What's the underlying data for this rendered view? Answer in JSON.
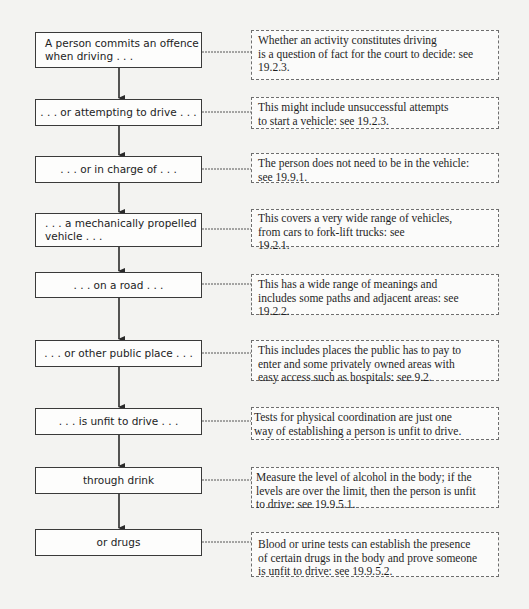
{
  "flowchart": {
    "steps": [
      {
        "label": "A person commits an offence\nwhen driving . . .",
        "note": "Whether an activity constitutes driving\nis a question of fact for the court to decide: see\n19.2.3."
      },
      {
        "label": ". . . or attempting to drive . . .",
        "note": "This might include unsuccessful attempts\nto start a vehicle: see 19.2.3."
      },
      {
        "label": ". . . or in charge of . . .",
        "note": "The person does not need to be in the vehicle:\nsee 19.9.1."
      },
      {
        "label": ". . . a mechanically propelled\nvehicle . . .",
        "note": "This covers a very wide range of vehicles,\nfrom cars to fork-lift trucks: see\n19.2.1."
      },
      {
        "label": ". . . on a road . . .",
        "note": "This has a wide range of meanings and\nincludes some paths and adjacent areas: see\n19.2.2."
      },
      {
        "label": ". . . or other public place . . .",
        "note": "This includes places the public has to pay to\nenter and some privately owned areas with\neasy access such as hospitals: see 9.2."
      },
      {
        "label": ". . . is unfit to drive . . .",
        "note": "Tests for physical coordination are just one\nway of establishing a person is unfit to drive."
      },
      {
        "label": "through drink",
        "note": "Measure the level of alcohol in the body; if the\nlevels are over the limit, then the person is unfit\nto drive: see 19.9.5.1."
      },
      {
        "label": "or drugs",
        "note": "Blood or urine tests can establish the presence\nof certain drugs in the body and prove someone\nis unfit to drive: see 19.9.5.2."
      }
    ]
  }
}
